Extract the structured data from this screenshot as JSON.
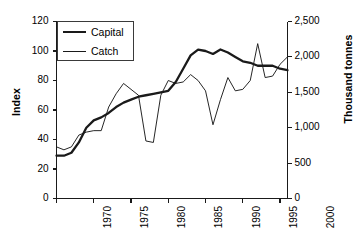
{
  "chart_data": {
    "type": "line",
    "title": "",
    "subtitle": "",
    "xlabel": "",
    "ylabel": "Index",
    "ylabel_right": "Thousand tonnes",
    "xlim": [
      1970,
      2001
    ],
    "ylim": [
      0,
      120
    ],
    "ylim_right": [
      0,
      2500
    ],
    "grid": false,
    "legend_position": "top-left",
    "xticks": [
      "1970",
      "1975",
      "1980",
      "1985",
      "1990",
      "1995",
      "2000"
    ],
    "xtick_values": [
      1970,
      1975,
      1980,
      1985,
      1990,
      1995,
      2000
    ],
    "yticks_left": [
      "0",
      "20",
      "40",
      "60",
      "80",
      "100",
      "120"
    ],
    "ytick_values_left": [
      0,
      20,
      40,
      60,
      80,
      100,
      120
    ],
    "yticks_right": [
      "0",
      "500",
      "1,000",
      "1,500",
      "2,000",
      "2,500"
    ],
    "ytick_values_right": [
      0,
      500,
      1000,
      1500,
      2000,
      2500
    ],
    "x": [
      1970,
      1971,
      1972,
      1973,
      1974,
      1975,
      1976,
      1977,
      1978,
      1979,
      1980,
      1981,
      1982,
      1983,
      1984,
      1985,
      1986,
      1987,
      1988,
      1989,
      1990,
      1991,
      1992,
      1993,
      1994,
      1995,
      1996,
      1997,
      1998,
      1999,
      2000,
      2001
    ],
    "series": [
      {
        "name": "Capital",
        "axis": "left",
        "units": "Index",
        "line_width": "thick",
        "color": "#1a1a1a",
        "values": [
          29,
          29,
          31,
          38,
          48,
          53,
          55,
          58,
          62,
          65,
          67,
          69,
          70,
          71,
          72,
          73,
          79,
          88,
          97,
          101,
          100,
          98,
          101,
          99,
          96,
          93,
          92,
          90,
          90,
          90,
          88,
          87
        ]
      },
      {
        "name": "Catch",
        "axis": "right",
        "units": "Thousand tonnes",
        "line_width": "thin",
        "color": "#1a1a1a",
        "values_index": [
          35,
          33,
          35,
          43,
          45,
          46,
          46,
          62,
          71,
          78,
          74,
          70,
          39,
          38,
          70,
          80,
          78,
          79,
          84,
          80,
          73,
          50,
          67,
          82,
          73,
          74,
          80,
          105,
          82,
          83,
          91,
          96
        ],
        "values": [
          729,
          688,
          729,
          896,
          938,
          958,
          958,
          1292,
          1479,
          1625,
          1542,
          1458,
          813,
          792,
          1458,
          1667,
          1625,
          1646,
          1750,
          1667,
          1521,
          1042,
          1396,
          1708,
          1521,
          1542,
          1667,
          2188,
          1708,
          1729,
          1896,
          2000
        ]
      }
    ]
  },
  "legend": {
    "entries": [
      {
        "label": "Capital",
        "style": "thick"
      },
      {
        "label": "Catch",
        "style": "thin"
      }
    ]
  },
  "axes": {
    "left_title": "Index",
    "right_title": "Thousand tonnes"
  }
}
